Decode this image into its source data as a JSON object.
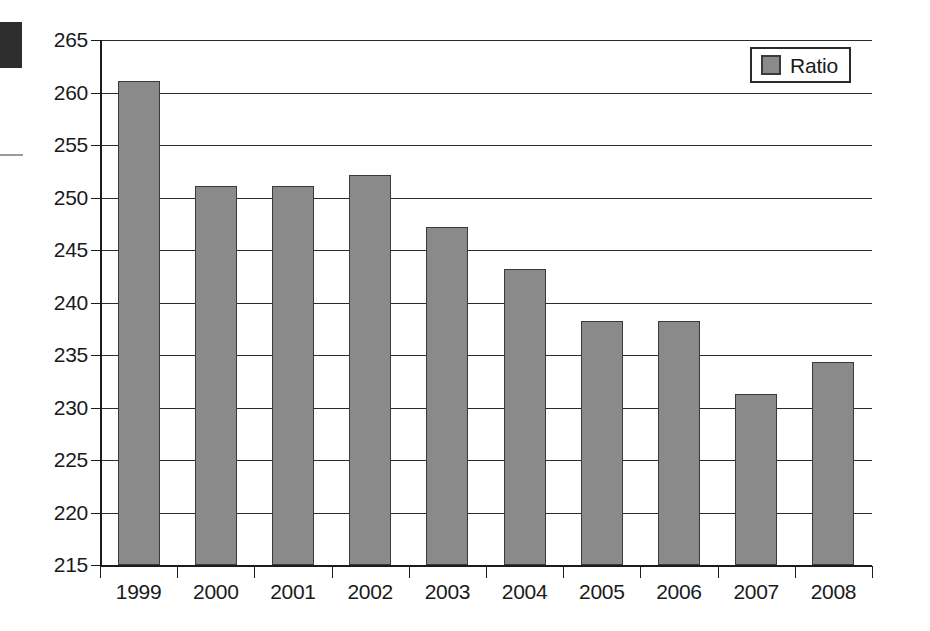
{
  "chart_data": {
    "type": "bar",
    "title": "",
    "subtitle": "",
    "xlabel": "",
    "ylabel": "",
    "categories": [
      "1999",
      "2000",
      "2001",
      "2002",
      "2003",
      "2004",
      "2005",
      "2006",
      "2007",
      "2008"
    ],
    "series": [
      {
        "name": "Ratio",
        "color": "#8a8a8a",
        "values": [
          261.1,
          251.1,
          251.1,
          252.1,
          247.2,
          243.2,
          238.2,
          238.2,
          231.3,
          234.3
        ]
      }
    ],
    "ylim": [
      215,
      265
    ],
    "yticks": [
      215,
      220,
      225,
      230,
      235,
      240,
      245,
      250,
      255,
      260,
      265
    ],
    "ytick_labels": [
      "215",
      "220",
      "225",
      "230",
      "235",
      "240",
      "245",
      "250",
      "255",
      "260",
      "265"
    ],
    "grid": true,
    "grid_axis": "y",
    "legend": {
      "position": "top-right",
      "entries": [
        {
          "label": "Ratio",
          "swatch_color": "#8a8a8a"
        }
      ]
    },
    "bar_edge_color": "#3a3a3a",
    "background_color": "#ffffff"
  },
  "legend": {
    "ratio_label": "Ratio"
  }
}
